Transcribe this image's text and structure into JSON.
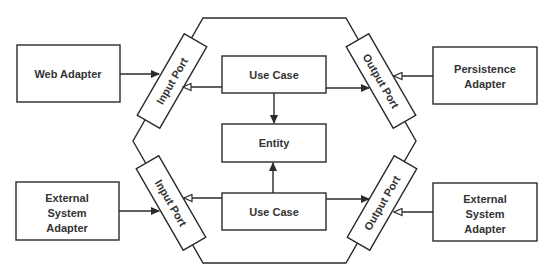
{
  "diagram": {
    "colors": {
      "stroke": "#2b2b2b",
      "text": "#333333",
      "background": "#ffffff"
    },
    "hexagon": {
      "points": "203,18 346,18 416,141 346,263 203,263 133,141"
    },
    "core": {
      "use_case_top": "Use Case",
      "entity": "Entity",
      "use_case_bottom": "Use Case"
    },
    "ports": {
      "input_top": "Input Port",
      "output_top": "Output Port",
      "input_bottom": "Input Port",
      "output_bottom": "Output Port"
    },
    "adapters": {
      "web": [
        "Web Adapter"
      ],
      "persistence": [
        "Persistence",
        "Adapter"
      ],
      "external_left": [
        "External",
        "System",
        "Adapter"
      ],
      "external_right": [
        "External",
        "System",
        "Adapter"
      ]
    }
  }
}
